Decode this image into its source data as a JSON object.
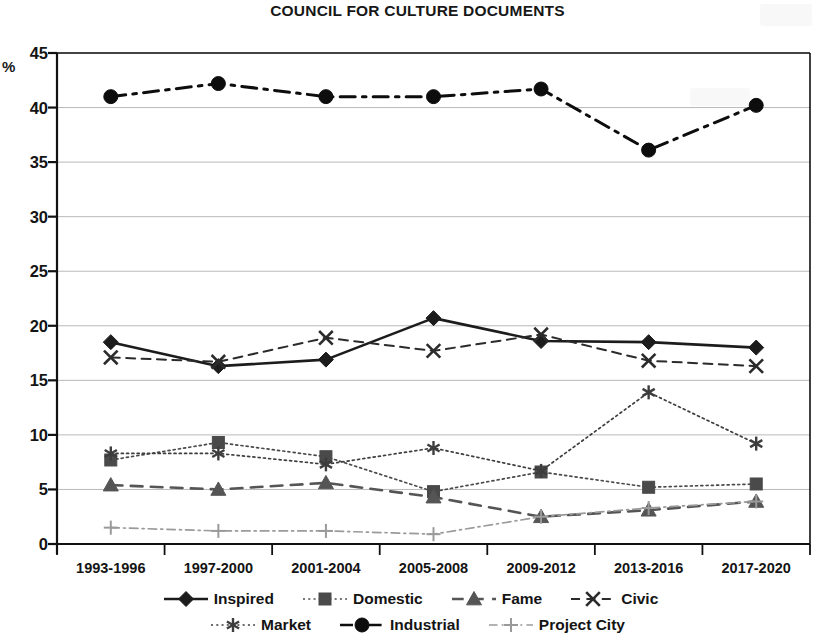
{
  "chart_data": {
    "type": "line",
    "title": "COUNCIL FOR CULTURE DOCUMENTS",
    "xlabel": "",
    "ylabel": "%",
    "ylim": [
      0,
      45
    ],
    "ytick_step": 5,
    "yticks": [
      0,
      5,
      10,
      15,
      20,
      25,
      30,
      35,
      40,
      45
    ],
    "grid": true,
    "legend_position": "bottom",
    "categories": [
      "1993-1996",
      "1997-2000",
      "2001-2004",
      "2005-2008",
      "2009-2012",
      "2013-2016",
      "2017-2020"
    ],
    "series": [
      {
        "name": "Inspired",
        "marker": "diamond",
        "line_style": "solid",
        "color": "#1c1c1c",
        "values": [
          18.5,
          16.3,
          16.9,
          20.7,
          18.6,
          18.5,
          18.0
        ]
      },
      {
        "name": "Domestic",
        "marker": "square",
        "line_style": "dotted",
        "color": "#4a4a4a",
        "values": [
          7.7,
          9.3,
          8.0,
          4.8,
          6.6,
          5.2,
          5.5
        ]
      },
      {
        "name": "Fame",
        "marker": "triangle",
        "line_style": "dashed",
        "color": "#555555",
        "values": [
          5.4,
          5.0,
          5.6,
          4.3,
          2.5,
          3.1,
          3.9
        ]
      },
      {
        "name": "Civic",
        "marker": "x",
        "line_style": "dashed",
        "color": "#2b2b2b",
        "values": [
          17.1,
          16.7,
          18.9,
          17.7,
          19.2,
          16.8,
          16.3
        ]
      },
      {
        "name": "Market",
        "marker": "asterisk",
        "line_style": "dotted",
        "color": "#3d3d3d",
        "values": [
          8.3,
          8.3,
          7.3,
          8.8,
          6.7,
          13.9,
          9.2
        ]
      },
      {
        "name": "Industrial",
        "marker": "circle",
        "line_style": "dashdot",
        "color": "#0d0d0d",
        "values": [
          41.0,
          42.2,
          41.0,
          41.0,
          41.7,
          36.1,
          40.2
        ]
      },
      {
        "name": "Project City",
        "marker": "plus",
        "line_style": "dashdot",
        "color": "#9a9a9a",
        "values": [
          1.5,
          1.2,
          1.2,
          0.9,
          2.5,
          3.3,
          3.9
        ]
      }
    ]
  },
  "legend": {
    "row1": [
      "Inspired",
      "Domestic",
      "Fame",
      "Civic"
    ],
    "row2": [
      "Market",
      "Industrial",
      "Project City"
    ]
  },
  "colors": {
    "axis": "#111111",
    "grid": "#b9b9b9",
    "background": "#ffffff"
  }
}
